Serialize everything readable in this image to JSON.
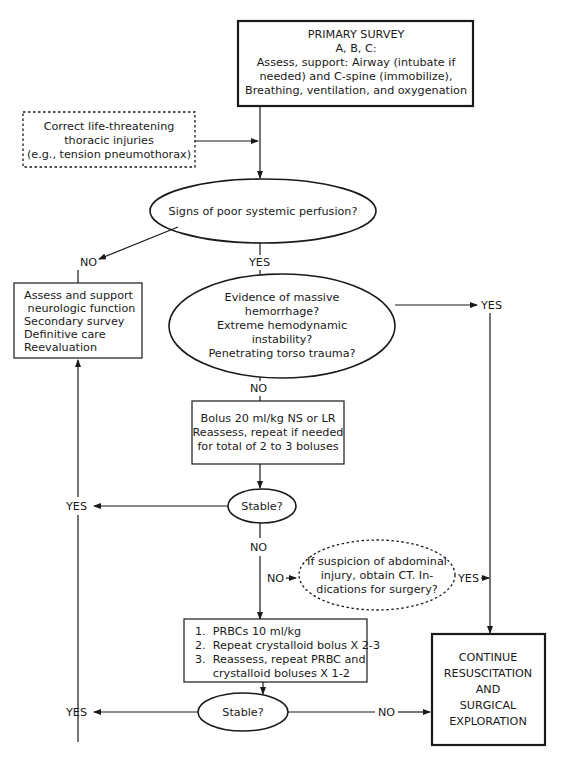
{
  "primary_survey": {
    "lines": [
      "PRIMARY SURVEY",
      "A, B, C:",
      "Assess, support:  Airway (intubate if",
      "needed) and C-spine (immobilize),",
      "Breathing, ventilation, and oxygenation"
    ]
  },
  "thoracic": {
    "lines": [
      "Correct life-threatening",
      "thoracic injuries",
      "(e.g., tension pneumothorax)"
    ]
  },
  "perfusion": {
    "text": "Signs of poor systemic perfusion?"
  },
  "labels": {
    "no_perfusion": "NO",
    "yes_perfusion": "YES",
    "yes_hemorrhage": "YES",
    "no_hemorrhage": "NO",
    "yes_stable1": "YES",
    "no_stable1": "NO",
    "no_ct": "NO",
    "yes_ct": "YES",
    "yes_stable2": "YES",
    "no_stable2": "NO"
  },
  "neuro": {
    "lines": [
      "Assess and support",
      " neurologic function",
      "Secondary survey",
      "Definitive care",
      "Reevaluation"
    ]
  },
  "hemorrhage": {
    "lines": [
      "Evidence of massive",
      "hemorrhage?",
      "Extreme hemodynamic",
      "instability?",
      "Penetrating torso trauma?"
    ]
  },
  "bolus": {
    "lines": [
      "Bolus 20 ml/kg NS or LR",
      "Reassess, repeat if needed",
      "for total of 2 to 3 boluses"
    ]
  },
  "stable1": {
    "text": "Stable?"
  },
  "ct": {
    "lines": [
      "If suspicion of abdominal",
      "injury, obtain CT.  In-",
      "dications for surgery?"
    ]
  },
  "prbc": {
    "lines": [
      "1.  PRBCs 10 ml/kg",
      "2.  Repeat crystalloid bolus X 2-3",
      "3.  Reassess, repeat PRBC and",
      "     crystalloid boluses X 1-2"
    ]
  },
  "stable2": {
    "text": "Stable?"
  },
  "surgery": {
    "lines": [
      "CONTINUE",
      "RESUSCITATION",
      "AND",
      "SURGICAL",
      "EXPLORATION"
    ]
  }
}
